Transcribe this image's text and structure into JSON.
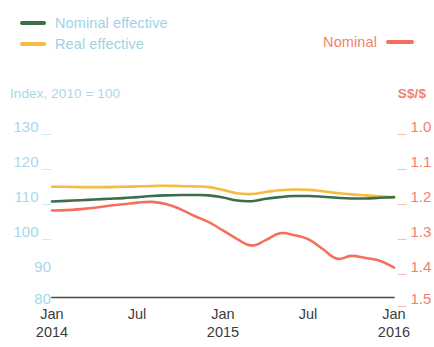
{
  "legend": {
    "items": [
      {
        "label": "Nominal effective",
        "color": "#3c6e4b",
        "name": "nominal-effective"
      },
      {
        "label": "Real effective",
        "color": "#f5bb45",
        "name": "real-effective"
      }
    ],
    "right": {
      "label": "Nominal",
      "color": "#f4705c",
      "name": "nominal"
    }
  },
  "axes": {
    "left_caption": "Index, 2010 = 100",
    "right_caption": "S$/$",
    "left_ticks": [
      "130",
      "120",
      "110",
      "100",
      "90",
      "80"
    ],
    "right_ticks": [
      "1.0",
      "1.1",
      "1.2",
      "1.3",
      "1.4",
      "1.5"
    ],
    "x_ticks": [
      {
        "month": "Jan",
        "year": "2014"
      },
      {
        "month": "Jul",
        "year": ""
      },
      {
        "month": "Jan",
        "year": "2015"
      },
      {
        "month": "Jul",
        "year": ""
      },
      {
        "month": "Jan",
        "year": "2016"
      }
    ]
  },
  "colors": {
    "nominal_effective": "#3c6e4b",
    "real_effective": "#f5bb45",
    "nominal_rate": "#f4705c",
    "left_axis_text": "#a8d8ea",
    "right_axis_text": "#f4806c",
    "axis_line": "#4a4a4a"
  },
  "chart_data": {
    "type": "line",
    "title": "",
    "xlabel": "",
    "ylabel": "Index, 2010 = 100",
    "y2label": "S$/$",
    "grid": false,
    "legend_position": "top",
    "ylim": [
      80,
      130
    ],
    "y2lim": [
      1.5,
      1.0
    ],
    "y2_inverted": true,
    "x": [
      "2014-01",
      "2014-02",
      "2014-03",
      "2014-04",
      "2014-05",
      "2014-06",
      "2014-07",
      "2014-08",
      "2014-09",
      "2014-10",
      "2014-11",
      "2014-12",
      "2015-01",
      "2015-02",
      "2015-03",
      "2015-04",
      "2015-05",
      "2015-06",
      "2015-07",
      "2015-08",
      "2015-09",
      "2015-10",
      "2015-11",
      "2015-12",
      "2016-01"
    ],
    "x_tick_labels": [
      "Jan 2014",
      "Jul",
      "Jan 2015",
      "Jul",
      "Jan 2016"
    ],
    "series": [
      {
        "name": "Nominal effective",
        "axis": "left",
        "color": "#3c6e4b",
        "values": [
          106.0,
          106.2,
          106.4,
          106.6,
          106.8,
          107.0,
          107.3,
          107.6,
          107.8,
          107.9,
          107.9,
          107.8,
          107.2,
          106.3,
          106.1,
          106.8,
          107.3,
          107.6,
          107.6,
          107.4,
          107.1,
          106.9,
          106.9,
          107.1,
          107.3
        ]
      },
      {
        "name": "Real effective",
        "axis": "left",
        "color": "#f5bb45",
        "values": [
          110.3,
          110.3,
          110.2,
          110.2,
          110.2,
          110.3,
          110.4,
          110.5,
          110.6,
          110.5,
          110.4,
          110.2,
          109.4,
          108.4,
          108.2,
          108.8,
          109.3,
          109.5,
          109.4,
          109.0,
          108.5,
          108.1,
          107.8,
          107.5,
          107.2
        ]
      },
      {
        "name": "Nominal",
        "axis": "right",
        "color": "#f4705c",
        "unit": "S$/$",
        "values": [
          1.266,
          1.265,
          1.262,
          1.258,
          1.252,
          1.248,
          1.243,
          1.241,
          1.247,
          1.262,
          1.282,
          1.3,
          1.324,
          1.349,
          1.368,
          1.352,
          1.332,
          1.338,
          1.35,
          1.378,
          1.406,
          1.398,
          1.404,
          1.412,
          1.432
        ]
      }
    ],
    "annotations": []
  }
}
